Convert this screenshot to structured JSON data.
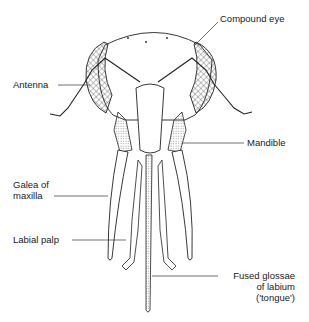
{
  "diagram": {
    "labels": {
      "compound_eye": "Compound eye",
      "antenna": "Antenna",
      "mandible": "Mandible",
      "galea_line1": "Galea of",
      "galea_line2": "maxilla",
      "labial_palp": "Labial palp",
      "tongue_line1": "Fused glossae",
      "tongue_line2": "of labium",
      "tongue_line3": "('tongue')"
    }
  }
}
